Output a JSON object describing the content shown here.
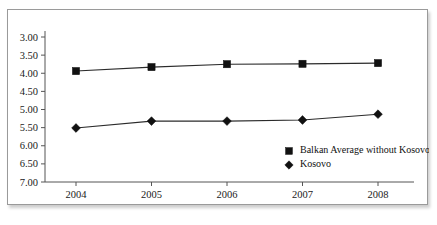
{
  "page": {
    "top_text_remnant": "",
    "background_color": "#ffffff"
  },
  "chart_frame": {
    "border_color": "#9a9a9a",
    "background_color": "#ffffff",
    "has_drop_shadow": true
  },
  "chart_data": {
    "type": "line",
    "title": "",
    "subtitle": "",
    "xlabel": "",
    "ylabel": "",
    "categories": [
      "2004",
      "2005",
      "2006",
      "2007",
      "2008"
    ],
    "x": [
      2004,
      2005,
      2006,
      2007,
      2008
    ],
    "series": [
      {
        "name": "Balkan Average without Kosovo",
        "marker": "square",
        "color": "#111111",
        "values": [
          3.94,
          3.83,
          3.75,
          3.74,
          3.72
        ]
      },
      {
        "name": "Kosovo",
        "marker": "diamond",
        "color": "#111111",
        "values": [
          5.51,
          5.32,
          5.32,
          5.29,
          5.13
        ]
      }
    ],
    "ylim": [
      3.0,
      7.0
    ],
    "y_axis_inverted": true,
    "ytick_labels": [
      "3.00",
      "3.50",
      "4.00",
      "4.50",
      "5.00",
      "5.50",
      "6.00",
      "6.50",
      "7.00"
    ],
    "ytick_values": [
      3.0,
      3.5,
      4.0,
      4.5,
      5.0,
      5.5,
      6.0,
      6.5,
      7.0
    ],
    "xtick_labels": [
      "2004",
      "2005",
      "2006",
      "2007",
      "2008"
    ],
    "grid": false,
    "legend_position": "inside-bottom-right",
    "legend_entries": [
      {
        "label": "Balkan Average without Kosovo",
        "marker": "square"
      },
      {
        "label": "Kosovo",
        "marker": "diamond"
      }
    ]
  }
}
